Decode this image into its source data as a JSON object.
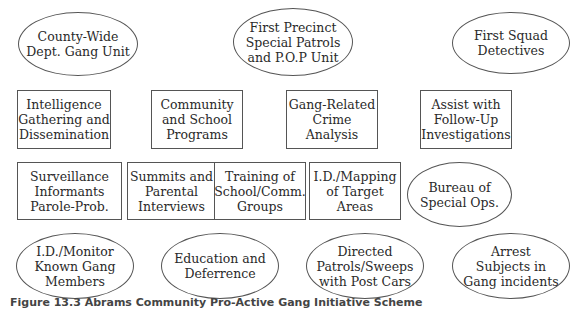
{
  "diagram": {
    "nodes": [
      {
        "id": "n1",
        "shape": "ellipse",
        "lines": [
          "County-Wide",
          "Dept. Gang Unit"
        ]
      },
      {
        "id": "n2",
        "shape": "ellipse",
        "lines": [
          "First Precinct",
          "Special Patrols",
          "and P.O.P Unit"
        ]
      },
      {
        "id": "n3",
        "shape": "ellipse",
        "lines": [
          "First Squad",
          "Detectives"
        ]
      },
      {
        "id": "n4",
        "shape": "box",
        "lines": [
          "Intelligence",
          "Gathering and",
          "Dissemination"
        ]
      },
      {
        "id": "n5",
        "shape": "box",
        "lines": [
          "Community",
          "and School",
          "Programs"
        ]
      },
      {
        "id": "n6",
        "shape": "box",
        "lines": [
          "Gang-Related",
          "Crime Analysis"
        ]
      },
      {
        "id": "n7",
        "shape": "box",
        "lines": [
          "Assist with",
          "Follow-Up",
          "Investigations"
        ]
      },
      {
        "id": "n8",
        "shape": "box",
        "lines": [
          "Surveillance",
          "Informants",
          "Parole-Prob."
        ]
      },
      {
        "id": "n9",
        "shape": "box",
        "lines": [
          "Summits and",
          "Parental",
          "Interviews"
        ]
      },
      {
        "id": "n10",
        "shape": "box",
        "lines": [
          "Training of",
          "School/Comm.",
          "Groups"
        ]
      },
      {
        "id": "n11",
        "shape": "box",
        "lines": [
          "I.D./Mapping",
          "of Target Areas"
        ]
      },
      {
        "id": "n12",
        "shape": "ellipse",
        "lines": [
          "Bureau of",
          "Special Ops."
        ]
      },
      {
        "id": "n13",
        "shape": "ellipse",
        "lines": [
          "I.D./Monitor",
          "Known Gang",
          "Members"
        ]
      },
      {
        "id": "n14",
        "shape": "ellipse",
        "lines": [
          "Education and",
          "Deferrence"
        ]
      },
      {
        "id": "n15",
        "shape": "ellipse",
        "lines": [
          "Directed",
          "Patrols/Sweeps",
          "with Post Cars"
        ]
      },
      {
        "id": "n16",
        "shape": "ellipse",
        "lines": [
          "Arrest",
          "Subjects in",
          "Gang incidents"
        ]
      }
    ]
  },
  "caption": "Figure 13.3  Abrams Community Pro-Active Gang Initiative Scheme"
}
